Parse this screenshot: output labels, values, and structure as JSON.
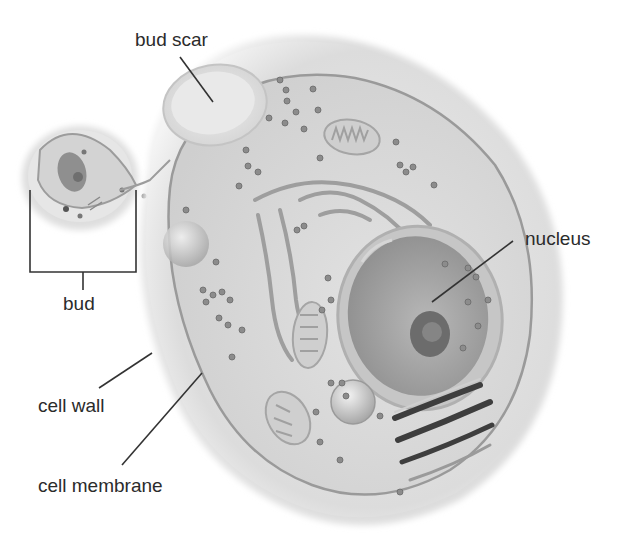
{
  "figure": {
    "cropped_heading": "",
    "colors": {
      "background": "#ffffff",
      "label_text": "#2b2b2b",
      "leader_line": "#333333",
      "cell_wall": "#e4e4e4",
      "cytoplasm": "#d9d9d9",
      "membrane": "#9a9a9a",
      "nucleus": "#a9a9a9",
      "nucleolus": "#6e6e6e",
      "ribosome": "#8a8a8a"
    }
  },
  "labels": [
    {
      "id": "bud-scar",
      "text": "bud scar",
      "x": 135,
      "y": 30
    },
    {
      "id": "bud",
      "text": "bud",
      "x": 63,
      "y": 294
    },
    {
      "id": "nucleus",
      "text": "nucleus",
      "x": 525,
      "y": 229
    },
    {
      "id": "cell-wall",
      "text": "cell wall",
      "x": 38,
      "y": 396
    },
    {
      "id": "cell-membrane",
      "text": "cell membrane",
      "x": 38,
      "y": 476
    }
  ]
}
